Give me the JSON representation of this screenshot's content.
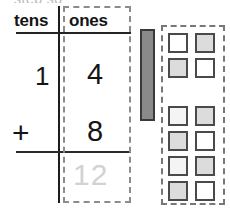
{
  "worksheet": {
    "cropped_top_text": "step      so",
    "columns": {
      "tens_label": "tens",
      "ones_label": "ones"
    },
    "problem": {
      "addend_one_tens": "1",
      "addend_one_ones": "4",
      "operator": "+",
      "addend_two_ones": "8",
      "answer_ones": "12"
    }
  },
  "manipulatives": {
    "rod": {
      "name": "ten-rod",
      "value": 10,
      "color": "#8a8a8a",
      "border_color": "#3a3a3a"
    },
    "cube_groups": [
      {
        "name": "ones-group-four",
        "count": 4,
        "shades": [
          "shade-c",
          "shade-b",
          "shade-b",
          "shade-c"
        ]
      },
      {
        "name": "ones-group-eight",
        "count": 8,
        "shades": [
          "shade-a",
          "shade-b",
          "shade-b",
          "shade-c",
          "shade-a",
          "shade-b",
          "shade-b",
          "shade-c"
        ]
      }
    ],
    "total_cubes": 12
  },
  "colors": {
    "ink": "#151515",
    "rule": "#242424",
    "dashed_outline": "#8c8c8c",
    "answer_gray": "#d2d2d2",
    "rod_fill": "#8a8a8a",
    "cube_border": "#4a4a4a"
  }
}
